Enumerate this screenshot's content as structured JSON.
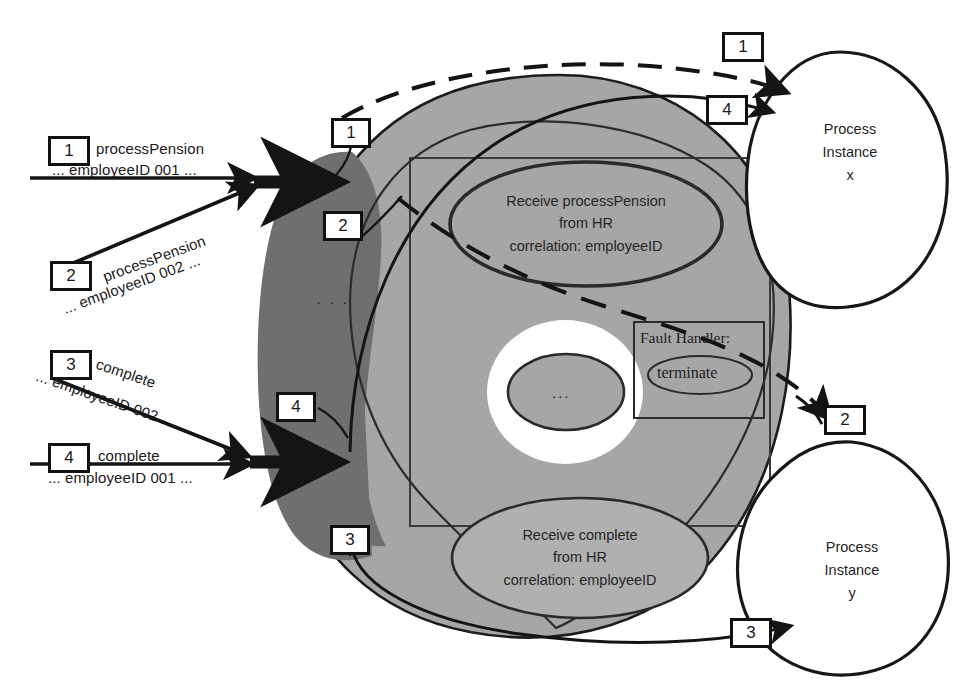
{
  "diagram": {
    "colors": {
      "dark_gray": "#6f6f6f",
      "mid_gray": "#a6a6a6",
      "light_gray": "#b4b4b4",
      "white": "#ffffff",
      "stroke": "#1a1a1a"
    },
    "inbound_messages": [
      {
        "num": "1",
        "line1": "processPension",
        "line2": "... employeeID 001 ..."
      },
      {
        "num": "2",
        "line1": "processPension",
        "line2": "... employeeID 002 ..."
      },
      {
        "num": "3",
        "line1": "complete",
        "line2": "... employeeID 002 ..."
      },
      {
        "num": "4",
        "line1": "complete",
        "line2": "... employeeID 001 ..."
      }
    ],
    "engine_markers": [
      {
        "num": "1"
      },
      {
        "num": "2"
      },
      {
        "num": "4"
      },
      {
        "num": "3"
      }
    ],
    "routing_markers": [
      {
        "num": "1"
      },
      {
        "num": "4"
      },
      {
        "num": "2"
      },
      {
        "num": "3"
      }
    ],
    "activities": {
      "receive_process_pension": "Receive processPension\nfrom HR\ncorrelation: employeeID",
      "receive_complete": "Receive complete\nfrom HR\ncorrelation: employeeID",
      "ellipsis_activity": "..."
    },
    "fault_handler": {
      "title": "Fault Handler:",
      "activity": "terminate"
    },
    "process_instances": [
      {
        "label": "Process\nInstance\nx"
      },
      {
        "label": "Process\nInstance\ny"
      }
    ],
    "queue_ellipsis": "·\n·\n·"
  }
}
